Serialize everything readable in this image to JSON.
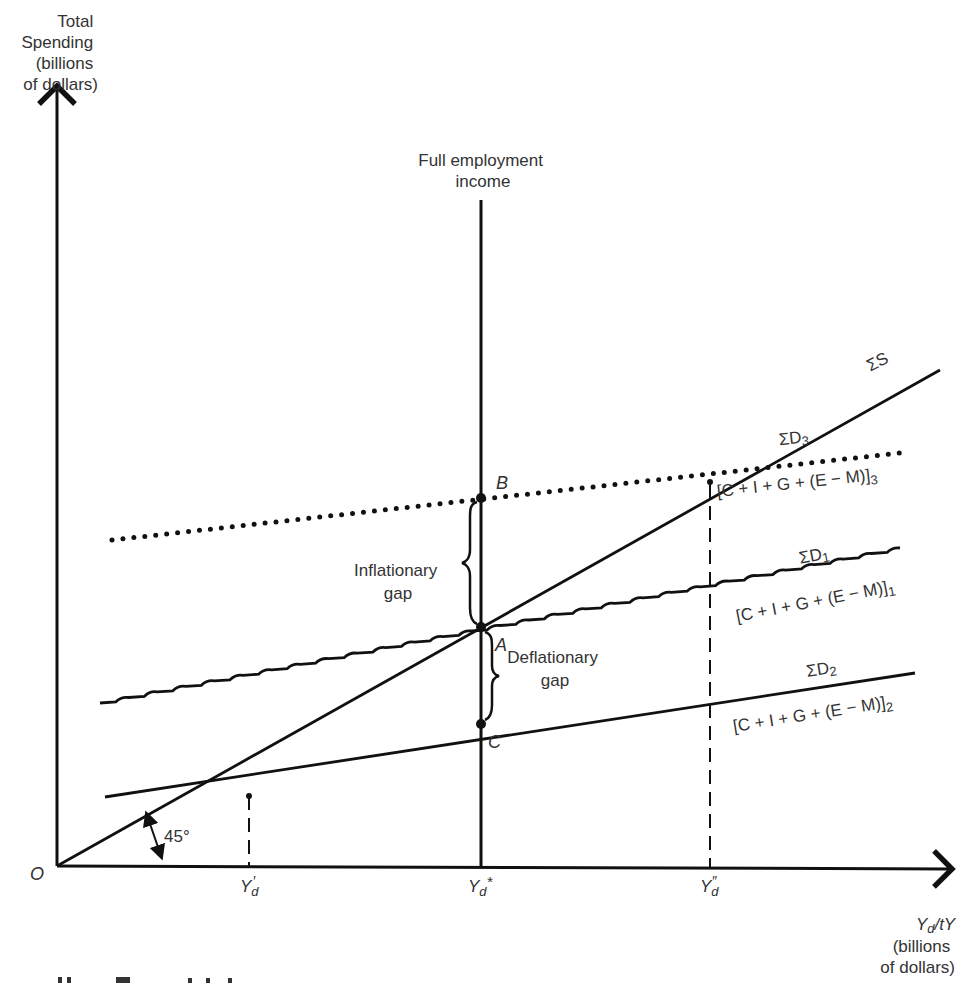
{
  "chart_data": {
    "type": "line",
    "ylabel": [
      "Total",
      "Spending",
      "(billions",
      "of dollars)"
    ],
    "xlabel": [
      "Yd/t",
      "(billions",
      "of dollars)"
    ],
    "origin_label": "O",
    "angle_label": "45°",
    "vertical_line_label": [
      "Full employment",
      "income"
    ],
    "x_ticks": [
      {
        "label": "Y'd",
        "base": "Y",
        "sub": "d",
        "sup": "′",
        "x": 249
      },
      {
        "label": "Yd*",
        "base": "Y",
        "sub": "d",
        "sup": "*",
        "x": 481
      },
      {
        "label": "Y''d",
        "base": "Y",
        "sub": "d",
        "sup": "″",
        "x": 710
      }
    ],
    "series": [
      {
        "name": "ΣS",
        "style": "solid",
        "label": "ΣS",
        "points": [
          [
            57,
            866
          ],
          [
            940,
            370
          ]
        ]
      },
      {
        "name": "ΣD3",
        "style": "dotted",
        "label": "ΣD3",
        "sublabel": "[C + I + G + (E − M)]3",
        "points": [
          [
            112,
            540
          ],
          [
            900,
            453
          ]
        ]
      },
      {
        "name": "ΣD1",
        "style": "wavy",
        "label": "ΣD1",
        "sublabel": "[C + I + G + (E − M)]1",
        "points": [
          [
            100,
            703
          ],
          [
            900,
            548
          ]
        ]
      },
      {
        "name": "ΣD2",
        "style": "solid",
        "label": "ΣD2",
        "sublabel": "[C + I + G + (E − M)]2",
        "points": [
          [
            105,
            797
          ],
          [
            915,
            673
          ]
        ]
      }
    ],
    "points": [
      {
        "label": "A",
        "x": 481,
        "y": 627
      },
      {
        "label": "B",
        "x": 481,
        "y": 498
      },
      {
        "label": "C",
        "x": 481,
        "y": 724
      }
    ],
    "annotations": [
      {
        "text": [
          "Inflationary",
          "gap"
        ],
        "between": [
          "B",
          "A"
        ]
      },
      {
        "text": [
          "Deflationary",
          "gap"
        ],
        "between": [
          "A",
          "C"
        ]
      }
    ],
    "grid": false,
    "legend": "none (inline labels)"
  },
  "labels": {
    "y_axis": [
      "Total",
      "Spending",
      "(billions",
      "of dollars)"
    ],
    "x_axis_main": "Y",
    "x_axis_sub": "d",
    "x_axis_t": "/t",
    "x_axis_units": [
      "(billions",
      "of dollars)"
    ],
    "origin": "O",
    "angle": "45°",
    "full_employment": [
      "Full employment",
      "income"
    ],
    "sigma_s": "ΣS",
    "sd3": {
      "sigma": "ΣD",
      "sub": "3",
      "expr": "[C + I + G + (E − M)]",
      "exprsub": "3"
    },
    "sd1": {
      "sigma": "ΣD",
      "sub": "1",
      "expr": "[C + I + G + (E − M)]",
      "exprsub": "1"
    },
    "sd2": {
      "sigma": "ΣD",
      "sub": "2",
      "expr": "[C + I + G + (E − M)]",
      "exprsub": "2"
    },
    "point_a": "A",
    "point_b": "B",
    "point_c": "C",
    "inflationary": [
      "Inflationary",
      "gap"
    ],
    "deflationary": [
      "Deflationary",
      "gap"
    ],
    "tick_y": "Y",
    "tick_d": "d",
    "tick_prime": "′",
    "tick_star": "*",
    "tick_dprime": "″"
  }
}
